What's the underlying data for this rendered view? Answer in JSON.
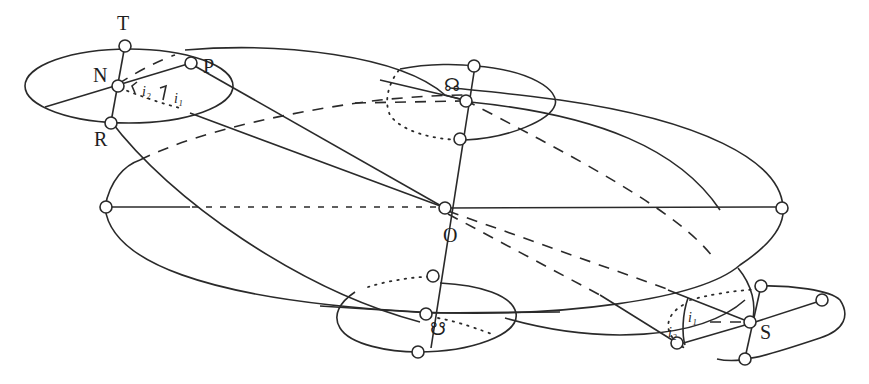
{
  "diagram": {
    "type": "celestial-sphere-orbit-geometry",
    "stroke_color": "#2a2a2a",
    "background": "#ffffff",
    "points": {
      "T": "T",
      "N": "N",
      "P": "P",
      "R": "R",
      "O": "O",
      "S": "S",
      "ascending_node": "☊",
      "descending_node": "☋"
    },
    "angle_labels": {
      "N_i2": "i₂",
      "N_i1": "i₁",
      "S_i1": "i₁",
      "S_i2": "i₂"
    }
  }
}
